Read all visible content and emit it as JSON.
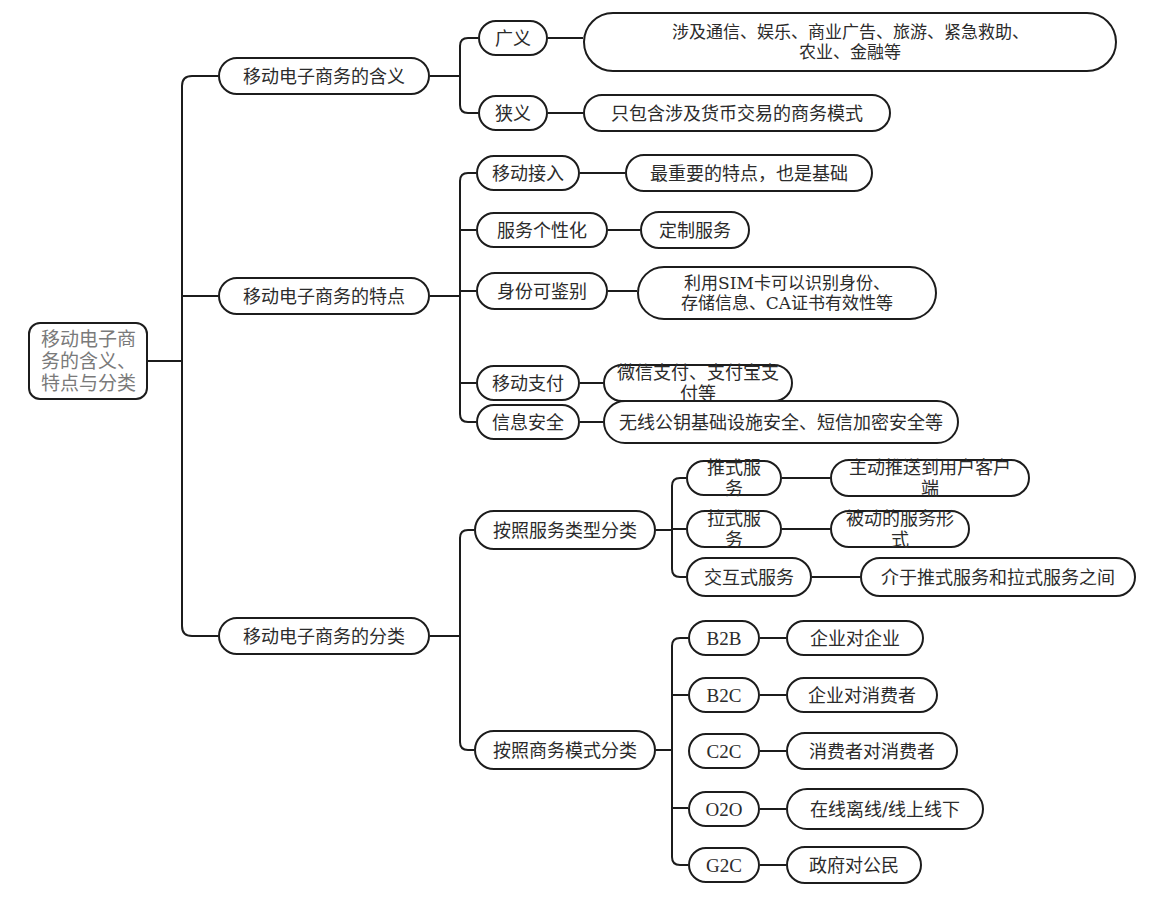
{
  "root": {
    "label": "移动电子商\n务的含义、\n特点与分类"
  },
  "branches": [
    {
      "label": "移动电子商务的含义",
      "children": [
        {
          "label": "广义",
          "detail": "涉及通信、娱乐、商业广告、旅游、紧急救助、\n农业、金融等"
        },
        {
          "label": "狭义",
          "detail": "只包含涉及货币交易的商务模式"
        }
      ]
    },
    {
      "label": "移动电子商务的特点",
      "children": [
        {
          "label": "移动接入",
          "detail": "最重要的特点，也是基础"
        },
        {
          "label": "服务个性化",
          "detail": "定制服务"
        },
        {
          "label": "身份可鉴别",
          "detail": "利用SIM卡可以识别身份、\n存储信息、CA证书有效性等"
        },
        {
          "label": "移动支付",
          "detail": "微信支付、支付宝支付等"
        },
        {
          "label": "信息安全",
          "detail": "无线公钥基础设施安全、短信加密安全等"
        }
      ]
    },
    {
      "label": "移动电子商务的分类",
      "children": [
        {
          "label": "按照服务类型分类",
          "children": [
            {
              "label": "推式服务",
              "detail": "主动推送到用户客户端"
            },
            {
              "label": "拉式服务",
              "detail": "被动的服务形式"
            },
            {
              "label": "交互式服务",
              "detail": "介于推式服务和拉式服务之间"
            }
          ]
        },
        {
          "label": "按照商务模式分类",
          "children": [
            {
              "label": "B2B",
              "detail": "企业对企业"
            },
            {
              "label": "B2C",
              "detail": "企业对消费者"
            },
            {
              "label": "C2C",
              "detail": "消费者对消费者"
            },
            {
              "label": "O2O",
              "detail": "在线离线/线上线下"
            },
            {
              "label": "G2C",
              "detail": "政府对公民"
            }
          ]
        }
      ]
    }
  ],
  "colors": {
    "line": "#1c1c1c",
    "root_text": "#7a7a7a",
    "text": "#2b2b2b",
    "background": "#ffffff"
  }
}
